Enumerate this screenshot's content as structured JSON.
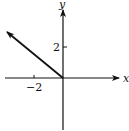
{
  "diagram": {
    "type": "vector-on-coordinate-plane",
    "axes": {
      "x_label": "x",
      "y_label": "y",
      "origin": [
        0,
        0
      ]
    },
    "ticks": {
      "x": [
        {
          "value": -2,
          "label": "−2"
        }
      ],
      "y": [
        {
          "value": 2,
          "label": "2"
        }
      ]
    },
    "vector": {
      "from": [
        0,
        0
      ],
      "to": [
        -4,
        3
      ],
      "color": "#111111"
    },
    "colors": {
      "line": "#111111",
      "background": "#ffffff"
    }
  }
}
